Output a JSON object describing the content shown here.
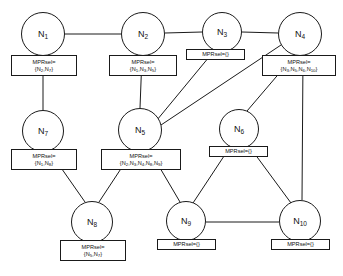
{
  "diagram": {
    "type": "network-graph",
    "mpr_prefix": "MPRsel=",
    "empty_set": "{}",
    "nodes": [
      {
        "id": "n1",
        "label": "N",
        "sub": "1",
        "cx": 43,
        "cy": 34,
        "r": 22,
        "mprsel": "{N2,N7}",
        "mpr_members": [
          "2",
          "7"
        ],
        "box": {
          "x": 11,
          "y": 55,
          "w": 66,
          "h": 21,
          "lines": 2
        }
      },
      {
        "id": "n2",
        "label": "N",
        "sub": "2",
        "cx": 143,
        "cy": 34,
        "r": 22,
        "mprsel": "{N1,N3,N5}",
        "mpr_members": [
          "1",
          "3",
          "5"
        ],
        "box": {
          "x": 109,
          "y": 55,
          "w": 68,
          "h": 21,
          "lines": 2
        }
      },
      {
        "id": "n3",
        "label": "N",
        "sub": "3",
        "cx": 222,
        "cy": 32,
        "r": 20,
        "mprsel": "{}",
        "mpr_members": [],
        "box": {
          "x": 186,
          "y": 49,
          "w": 59,
          "h": 11,
          "lines": 1
        }
      },
      {
        "id": "n4",
        "label": "N",
        "sub": "4",
        "cx": 300,
        "cy": 34,
        "r": 22,
        "mprsel": "{N3,N5,N6,N10}",
        "mpr_members": [
          "3",
          "5",
          "6",
          "10"
        ],
        "box": {
          "x": 262,
          "y": 55,
          "w": 74,
          "h": 21,
          "lines": 2
        }
      },
      {
        "id": "n7",
        "label": "N",
        "sub": "7",
        "cx": 43,
        "cy": 131,
        "r": 21,
        "mprsel": "{N1,N8}",
        "mpr_members": [
          "1",
          "8"
        ],
        "box": {
          "x": 11,
          "y": 149,
          "w": 66,
          "h": 21,
          "lines": 2
        }
      },
      {
        "id": "n5",
        "label": "N",
        "sub": "5",
        "cx": 140,
        "cy": 130,
        "r": 22,
        "mprsel": "{N2,N3,N4,N8,N9}",
        "mpr_members": [
          "2",
          "3",
          "4",
          "8",
          "9"
        ],
        "box": {
          "x": 101,
          "y": 149,
          "w": 80,
          "h": 21,
          "lines": 2
        }
      },
      {
        "id": "n6",
        "label": "N",
        "sub": "6",
        "cx": 239,
        "cy": 129,
        "r": 20,
        "mprsel": "{}",
        "mpr_members": [],
        "box": {
          "x": 209,
          "y": 146,
          "w": 59,
          "h": 11,
          "lines": 1
        }
      },
      {
        "id": "n8",
        "label": "N",
        "sub": "8",
        "cx": 92,
        "cy": 222,
        "r": 21,
        "mprsel": "{N5,N7}",
        "mpr_members": [
          "5",
          "7"
        ],
        "box": {
          "x": 60,
          "y": 240,
          "w": 66,
          "h": 21,
          "lines": 2
        }
      },
      {
        "id": "n9",
        "label": "N",
        "sub": "9",
        "cx": 186,
        "cy": 221,
        "r": 20,
        "mprsel": "{}",
        "mpr_members": [],
        "box": {
          "x": 157,
          "y": 239,
          "w": 59,
          "h": 11,
          "lines": 1
        }
      },
      {
        "id": "n10",
        "label": "N",
        "sub": "10",
        "cx": 300,
        "cy": 221,
        "r": 21,
        "mprsel": "{}",
        "mpr_members": [],
        "box": {
          "x": 271,
          "y": 239,
          "w": 59,
          "h": 11,
          "lines": 1
        }
      }
    ],
    "edges": [
      {
        "from": "n1",
        "to": "n2",
        "path": "M 65,34 L 121,34"
      },
      {
        "from": "n2",
        "to": "n3",
        "path": "M 165,33 L 202,32"
      },
      {
        "from": "n3",
        "to": "n4",
        "path": "M 242,32 L 278,33"
      },
      {
        "from": "n1",
        "to": "n7",
        "path": "M 43,56 L 43,110"
      },
      {
        "from": "n2",
        "to": "n5",
        "path": "M 142,56 L 140,108"
      },
      {
        "from": "n3",
        "to": "n5",
        "path": "M 214,51 L 157,120"
      },
      {
        "from": "n4",
        "to": "n5",
        "path": "M 281,45 L 161,125"
      },
      {
        "from": "n4",
        "to": "n6",
        "path": "M 294,56 L 247,111"
      },
      {
        "from": "n4",
        "to": "n10",
        "path": "M 303,56 L 302,200"
      },
      {
        "from": "n7",
        "to": "n8",
        "path": "M 50,152 L 85,202"
      },
      {
        "from": "n5",
        "to": "n8",
        "path": "M 132,152 L 99,202"
      },
      {
        "from": "n5",
        "to": "n9",
        "path": "M 150,151 L 180,202"
      },
      {
        "from": "n6",
        "to": "n9",
        "path": "M 230,147 L 193,203"
      },
      {
        "from": "n6",
        "to": "n10",
        "path": "M 249,146 L 291,203"
      },
      {
        "from": "n9",
        "to": "n10",
        "path": "M 206,222 L 279,222"
      }
    ],
    "style": {
      "stroke": "#1a1a1a",
      "background": "#ffffff",
      "text": "#111111"
    }
  }
}
